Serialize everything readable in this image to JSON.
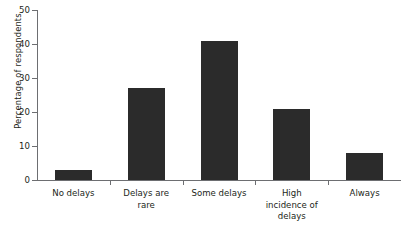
{
  "chart_data": {
    "type": "bar",
    "title": "",
    "xlabel": "",
    "ylabel": "Percentage of respondents",
    "categories": [
      "No delays",
      "Delays are rare",
      "Some delays",
      "High incidence of delays",
      "Always"
    ],
    "category_lines": [
      [
        "No delays"
      ],
      [
        "Delays are",
        "rare"
      ],
      [
        "Some delays"
      ],
      [
        "High",
        "incidence of",
        "delays"
      ],
      [
        "Always"
      ]
    ],
    "values": [
      3,
      27,
      41,
      21,
      8
    ],
    "ylim": [
      0,
      50
    ],
    "ytick_labels": [
      "0",
      "10",
      "20",
      "30",
      "40",
      "50"
    ],
    "ytick_values": [
      0,
      10,
      20,
      30,
      40,
      50
    ],
    "grid": false,
    "legend": false,
    "bar_color": "#2b2b2b",
    "axis_color": "#6d6e71",
    "text_color": "#231f20",
    "background": "#ffffff"
  }
}
